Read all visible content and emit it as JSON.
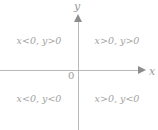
{
  "figure": {
    "type": "cartesian-quadrant-sign-diagram",
    "background_color": "#ffffff",
    "axis_color": "#b9b9b9",
    "text_color": "#a2a2a2"
  },
  "axes": {
    "x_label": "x",
    "y_label": "y",
    "origin_label": "0",
    "x_arrow_icon": "arrow-right-icon",
    "y_arrow_icon": "arrow-up-icon"
  },
  "quadrants": [
    {
      "id": "quadrant-1",
      "position": "top-right",
      "label": "x>0, y>0"
    },
    {
      "id": "quadrant-2",
      "position": "top-left",
      "label": "x<0, y>0"
    },
    {
      "id": "quadrant-3",
      "position": "bottom-left",
      "label": "x<0, y<0"
    },
    {
      "id": "quadrant-4",
      "position": "bottom-right",
      "label": "x>0, y<0"
    }
  ]
}
